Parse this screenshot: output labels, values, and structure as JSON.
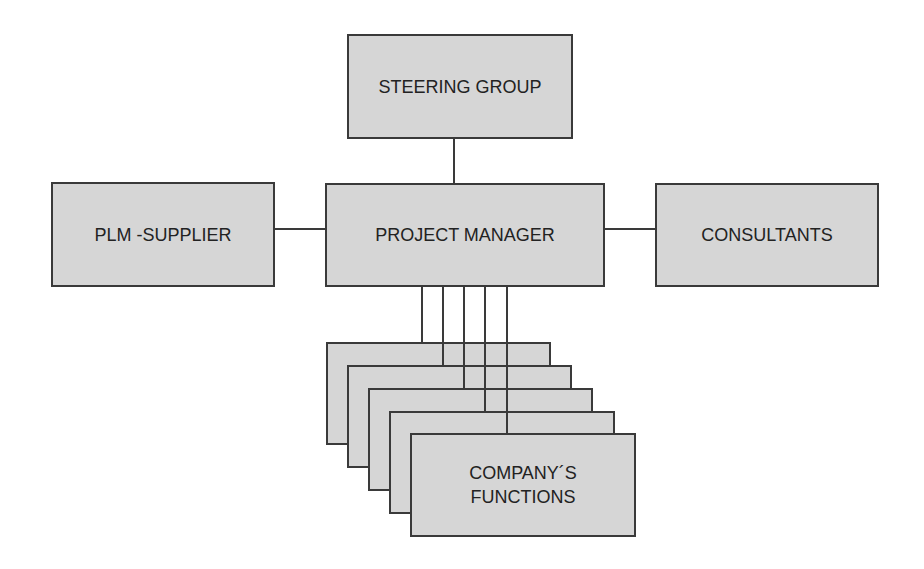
{
  "diagram": {
    "type": "organization-chart",
    "colors": {
      "box_fill": "#d6d6d6",
      "border": "#3a3a3a",
      "text": "#222222",
      "background": "#ffffff"
    },
    "nodes": {
      "steering_group": "STEERING GROUP",
      "project_manager": "PROJECT MANAGER",
      "plm_supplier": "PLM -SUPPLIER",
      "consultants": "CONSULTANTS",
      "company_functions": "COMPANY´S\nFUNCTIONS"
    },
    "edges": [
      [
        "STEERING GROUP",
        "PROJECT MANAGER"
      ],
      [
        "PLM -SUPPLIER",
        "PROJECT MANAGER"
      ],
      [
        "PROJECT MANAGER",
        "CONSULTANTS"
      ],
      [
        "PROJECT MANAGER",
        "COMPANY´S FUNCTIONS (x5 stacked)"
      ]
    ],
    "stacked_function_boxes": 5
  }
}
